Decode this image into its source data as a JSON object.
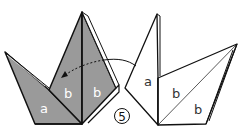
{
  "diagram": {
    "step_number": "5",
    "colors": {
      "paper_back": "#9a9a9a",
      "paper_front": "#ffffff",
      "line": "#111111",
      "label_on_gray": "#ffffff",
      "label_on_white": "#333333"
    },
    "left_figure": {
      "labels": {
        "a": "a",
        "b1": "b",
        "b2": "b"
      }
    },
    "right_figure": {
      "labels": {
        "a": "a",
        "b1": "b",
        "b2": "b"
      }
    },
    "arrow": {
      "style": "dashed-to-solid curved fold arrow",
      "direction": "right-to-left"
    }
  }
}
